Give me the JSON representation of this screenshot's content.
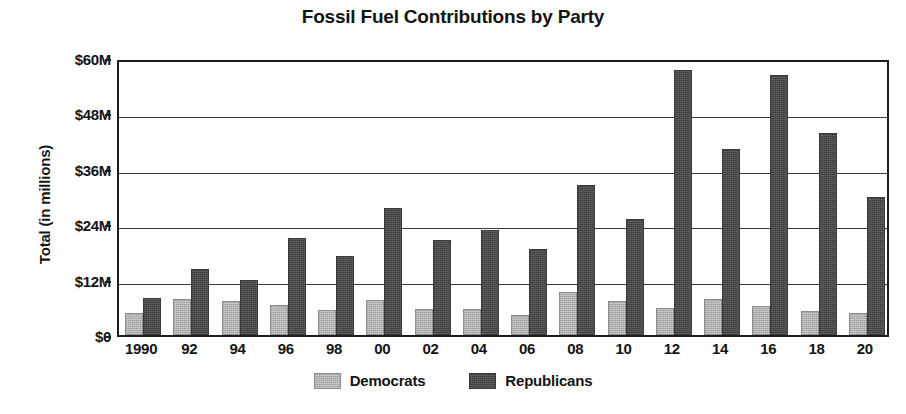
{
  "chart_data": {
    "type": "bar",
    "title": "Fossil Fuel Contributions by Party",
    "xlabel": "",
    "ylabel": "Total (in millions)",
    "categories": [
      "1990",
      "92",
      "94",
      "96",
      "98",
      "00",
      "02",
      "04",
      "06",
      "08",
      "10",
      "12",
      "14",
      "16",
      "18",
      "20"
    ],
    "series": [
      {
        "name": "Democrats",
        "color": "#b0b0b0",
        "values": [
          4.7,
          7.9,
          7.3,
          6.6,
          5.4,
          7.5,
          5.6,
          5.6,
          4.3,
          9.4,
          7.3,
          5.8,
          7.7,
          6.2,
          5.1,
          4.7
        ]
      },
      {
        "name": "Republicans",
        "color": "#4a4a4a",
        "values": [
          8.1,
          14.3,
          11.9,
          21.0,
          17.2,
          27.5,
          20.6,
          22.8,
          18.7,
          32.5,
          25.2,
          57.3,
          40.4,
          56.3,
          43.8,
          30.0
        ]
      }
    ],
    "ylim": [
      0,
      60
    ],
    "yticks": [
      0,
      12,
      24,
      36,
      48,
      60
    ],
    "ytick_labels": [
      "$0",
      "$12M",
      "$24M",
      "$36M",
      "$48M",
      "$60M"
    ],
    "grid": "horizontal",
    "legend_position": "bottom"
  },
  "legend": [
    {
      "label": "Democrats",
      "swatch": "democrats-swatch"
    },
    {
      "label": "Republicans",
      "swatch": "republicans-swatch"
    }
  ]
}
